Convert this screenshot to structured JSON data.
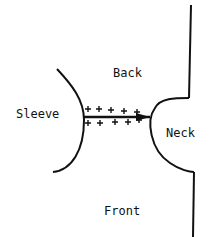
{
  "labels": {
    "back": "Back",
    "sleeve": "Sleeve",
    "neck": "Neck",
    "front": "Front"
  },
  "colors": {
    "line": "#111111",
    "background": "#ffffff"
  }
}
